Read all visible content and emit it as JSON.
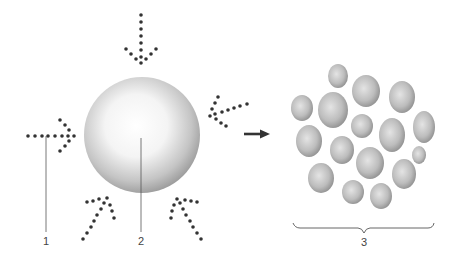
{
  "diagram": {
    "type": "illustration",
    "labels": [
      {
        "id": "1",
        "text": "1",
        "x": 28,
        "y": 236
      },
      {
        "id": "2",
        "text": "2",
        "x": 141,
        "y": 236
      },
      {
        "id": "3",
        "text": "3",
        "x": 363,
        "y": 236
      }
    ],
    "colors": {
      "dots": "#333333",
      "line": "#555555",
      "sphere_light": "#ffffff",
      "sphere_dark": "#9a9a9a",
      "droplet_light": "#e8e8e8",
      "droplet_dark": "#8a8a8a"
    },
    "sphere": {
      "cx": 142,
      "cy": 135,
      "r": 58
    },
    "transition_arrow": {
      "x1": 244,
      "y1": 134,
      "x2": 268,
      "y2": 134
    },
    "droplets": [
      {
        "cx": 338,
        "cy": 76,
        "rx": 10,
        "ry": 12
      },
      {
        "cx": 366,
        "cy": 91,
        "rx": 14,
        "ry": 16
      },
      {
        "cx": 402,
        "cy": 97,
        "rx": 13,
        "ry": 16
      },
      {
        "cx": 302,
        "cy": 108,
        "rx": 11,
        "ry": 13
      },
      {
        "cx": 333,
        "cy": 110,
        "rx": 15,
        "ry": 18
      },
      {
        "cx": 362,
        "cy": 126,
        "rx": 11,
        "ry": 12
      },
      {
        "cx": 392,
        "cy": 135,
        "rx": 13,
        "ry": 17
      },
      {
        "cx": 424,
        "cy": 127,
        "rx": 11,
        "ry": 16
      },
      {
        "cx": 309,
        "cy": 141,
        "rx": 13,
        "ry": 16
      },
      {
        "cx": 342,
        "cy": 150,
        "rx": 12,
        "ry": 14
      },
      {
        "cx": 419,
        "cy": 155,
        "rx": 7,
        "ry": 9
      },
      {
        "cx": 370,
        "cy": 163,
        "rx": 14,
        "ry": 16
      },
      {
        "cx": 404,
        "cy": 174,
        "rx": 12,
        "ry": 15
      },
      {
        "cx": 321,
        "cy": 178,
        "rx": 13,
        "ry": 15
      },
      {
        "cx": 353,
        "cy": 192,
        "rx": 11,
        "ry": 12
      },
      {
        "cx": 381,
        "cy": 196,
        "rx": 11,
        "ry": 13
      }
    ],
    "brace": {
      "x1": 293,
      "x2": 434,
      "y": 227
    }
  }
}
